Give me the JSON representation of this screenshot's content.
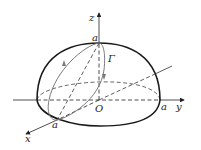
{
  "figure": {
    "labels": {
      "z_axis": "z",
      "y_axis": "y",
      "x_axis": "x",
      "origin": "O",
      "a_top": "a",
      "a_right": "a",
      "a_front": "a",
      "curve": "Γ"
    },
    "colors": {
      "outline": "#1a1a1a",
      "curve": "#7a7a7a",
      "axis": "#222222"
    }
  }
}
